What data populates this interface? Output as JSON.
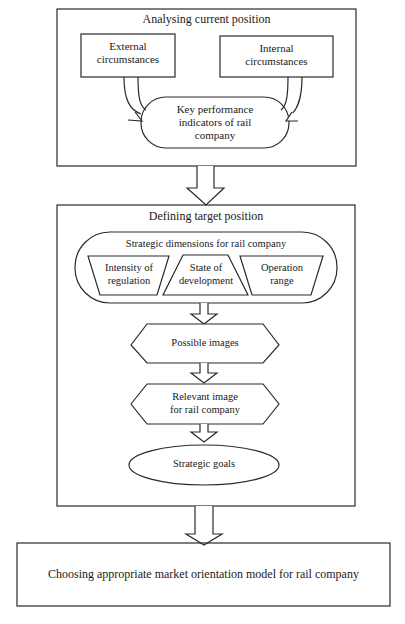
{
  "diagram": {
    "type": "flowchart",
    "stages": [
      {
        "id": "analysing",
        "title": "Analysing current position",
        "inputs": [
          {
            "id": "external",
            "label_line1": "External",
            "label_line2": "circumstances"
          },
          {
            "id": "internal",
            "label_line1": "Internal",
            "label_line2": "circumstances"
          }
        ],
        "output": {
          "id": "kpi",
          "label_line1": "Key performance",
          "label_line2": "indicators of rail",
          "label_line3": "company"
        }
      },
      {
        "id": "defining",
        "title": "Defining target position",
        "dimensions_group": {
          "title": "Strategic dimensions for rail company",
          "items": [
            {
              "label_line1": "Intensity of",
              "label_line2": "regulation"
            },
            {
              "label_line1": "State of",
              "label_line2": "development"
            },
            {
              "label_line1": "Operation",
              "label_line2": "range"
            }
          ]
        },
        "steps": [
          {
            "id": "possible",
            "label_line1": "Possible images"
          },
          {
            "id": "relevant",
            "label_line1": "Relevant image",
            "label_line2": "for rail company"
          },
          {
            "id": "goals",
            "label_line1": "Strategic goals"
          }
        ]
      },
      {
        "id": "choosing",
        "title": "Choosing appropriate market orientation model for rail company"
      }
    ],
    "colors": {
      "stroke": "#2a2a2a",
      "background": "#ffffff",
      "text": "#1a1a1a"
    }
  }
}
